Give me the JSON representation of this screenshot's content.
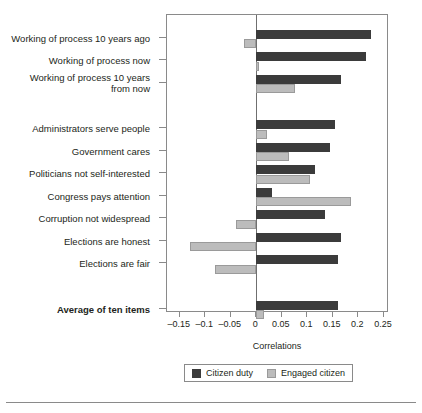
{
  "chart_data": {
    "type": "bar",
    "orientation": "horizontal",
    "title": "",
    "xlabel": "Correlations",
    "ylabel": "",
    "xlim": [
      -0.175,
      0.26
    ],
    "grid": false,
    "legend_position": "bottom",
    "xticks": [
      -0.15,
      -0.1,
      -0.05,
      0,
      0.05,
      0.1,
      0.15,
      0.2,
      0.25
    ],
    "xtick_labels": [
      "–0.15",
      "–0.1",
      "–0.05",
      "0",
      "0.05",
      "0.1",
      "0.15",
      "0.2",
      "0.25"
    ],
    "categories": [
      "Working of process 10 years ago",
      "Working of process now",
      "Working of process 10 years\nfrom now",
      "Administrators serve people",
      "Government cares",
      "Politicians not self-interested",
      "Congress pays attention",
      "Corruption not widespread",
      "Elections are honest",
      "Elections are fair",
      "Average of ten items"
    ],
    "series": [
      {
        "name": "Citizen duty",
        "color": "#3b3b3b",
        "values": [
          0.225,
          0.215,
          0.165,
          0.155,
          0.145,
          0.115,
          0.03,
          0.135,
          0.165,
          0.16,
          0.16
        ]
      },
      {
        "name": "Engaged citizen",
        "color": "#bcbcbc",
        "values": [
          -0.025,
          0.005,
          0.075,
          0.02,
          0.065,
          0.105,
          0.185,
          -0.04,
          -0.13,
          -0.08,
          0.015
        ]
      }
    ]
  },
  "axis": {
    "x_title": "Correlations"
  },
  "legend": {
    "items": [
      {
        "label": "Citizen duty",
        "swatch": "duty-swatch"
      },
      {
        "label": "Engaged citizen",
        "swatch": "engaged-swatch"
      }
    ]
  }
}
